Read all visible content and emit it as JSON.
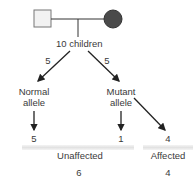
{
  "pedigree": {
    "father": {
      "shape": "square",
      "fill": "#f2f2f2",
      "stroke": "#777777"
    },
    "mother": {
      "shape": "circle",
      "fill": "#4a4a4a",
      "stroke": "#333333"
    }
  },
  "offspring": {
    "label": "10 children"
  },
  "branches": {
    "left": {
      "count": "5",
      "label_line1": "Normal",
      "label_line2": "allele",
      "result": "5"
    },
    "right": {
      "count": "5",
      "label_line1": "Mutant",
      "label_line2": "allele",
      "result_unaffected": "1",
      "result_affected": "4"
    }
  },
  "summary": {
    "unaffected": {
      "label": "Unaffected",
      "total": "6"
    },
    "affected": {
      "label": "Affected",
      "total": "4"
    }
  },
  "colors": {
    "line": "#222222",
    "band": "#e6e6e6"
  }
}
